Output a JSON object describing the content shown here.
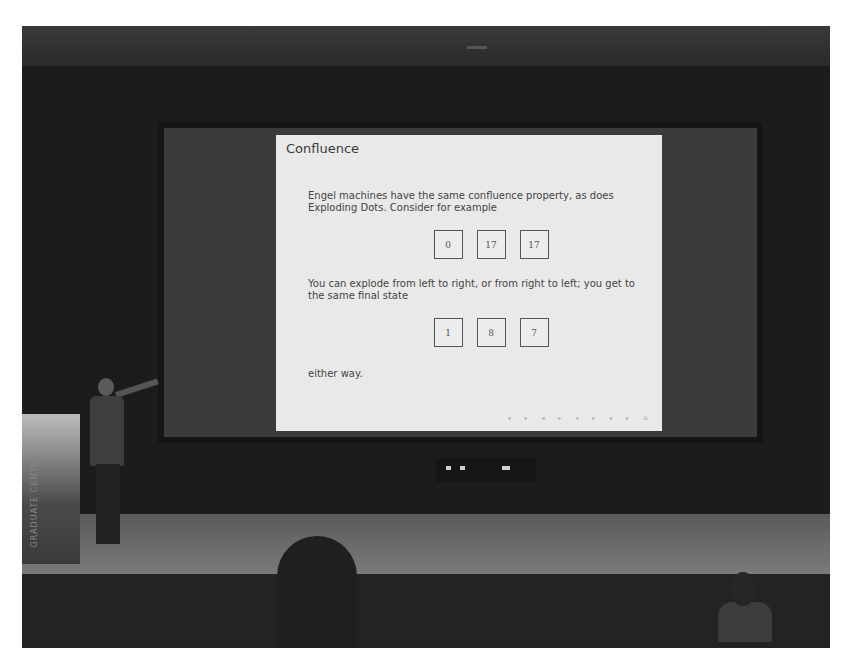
{
  "scene": {
    "description": "Photograph of a lecture: a speaker on stage points at a projected slide",
    "podium_text": "GRADUATE CENTER"
  },
  "slide": {
    "title": "Confluence",
    "paragraph_1": "Engel machines have the same confluence property, as does Exploding Dots. Consider for example",
    "initial_state": [
      "0",
      "17",
      "17"
    ],
    "paragraph_2": "You can explode from left to right, or from right to left; you get to the same final state",
    "final_state": [
      "1",
      "8",
      "7"
    ],
    "paragraph_3": "either way.",
    "nav_symbols": "◂ ▸ ◂ ▸ ◂ ▸ ◂ ▸ ≡"
  }
}
